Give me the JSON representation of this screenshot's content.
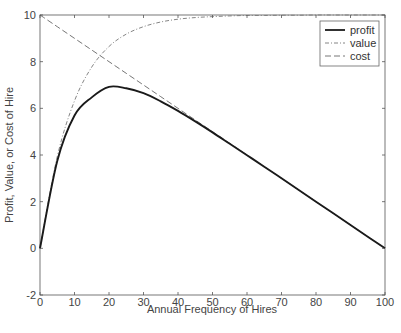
{
  "chart_data": {
    "type": "line",
    "title": "",
    "xlabel": "Annual Frequency of Hires",
    "ylabel": "Profit, Value, or Cost of Hire",
    "xlim": [
      0,
      100
    ],
    "ylim": [
      -2,
      10
    ],
    "xticks": [
      0,
      10,
      20,
      30,
      40,
      50,
      60,
      70,
      80,
      90,
      100
    ],
    "yticks": [
      -2,
      0,
      2,
      4,
      6,
      8,
      10
    ],
    "grid": false,
    "legend_position": "upper right",
    "x": [
      0,
      5,
      10,
      15,
      20,
      25,
      30,
      35,
      40,
      45,
      50,
      55,
      60,
      65,
      70,
      75,
      80,
      85,
      90,
      95,
      100
    ],
    "series": [
      {
        "name": "profit",
        "style": "solid",
        "values": [
          0,
          3.74,
          5.69,
          6.47,
          6.92,
          6.86,
          6.65,
          6.3,
          5.89,
          5.44,
          4.97,
          4.48,
          3.99,
          3.5,
          3.0,
          2.5,
          2.0,
          1.5,
          1.0,
          0.5,
          0
        ]
      },
      {
        "name": "value",
        "style": "dash-dot",
        "values": [
          0,
          3.93,
          6.32,
          7.77,
          8.65,
          9.18,
          9.5,
          9.7,
          9.82,
          9.89,
          9.93,
          9.96,
          9.98,
          9.98,
          9.99,
          9.99,
          10,
          10,
          10,
          10,
          10
        ]
      },
      {
        "name": "cost",
        "style": "dashed",
        "values": [
          10,
          9.5,
          9.0,
          8.5,
          8.0,
          7.5,
          7.0,
          6.5,
          6.0,
          5.5,
          5.0,
          4.5,
          4.0,
          3.5,
          3.0,
          2.5,
          2.0,
          1.5,
          1.0,
          0.5,
          0
        ]
      }
    ]
  },
  "legend": {
    "items": [
      {
        "label": "profit"
      },
      {
        "label": "value"
      },
      {
        "label": "cost"
      }
    ]
  },
  "axes": {
    "xlabel": "Annual Frequency of Hires",
    "ylabel": "Profit, Value, or Cost of Hire",
    "xtick_labels": [
      "0",
      "10",
      "20",
      "30",
      "40",
      "50",
      "60",
      "70",
      "80",
      "90",
      "100"
    ],
    "ytick_labels": [
      "-2",
      "0",
      "2",
      "4",
      "6",
      "8",
      "10"
    ]
  },
  "colors": {
    "profit": "#1a1a1a",
    "value": "#777777",
    "cost": "#666666",
    "axis": "#555555"
  }
}
